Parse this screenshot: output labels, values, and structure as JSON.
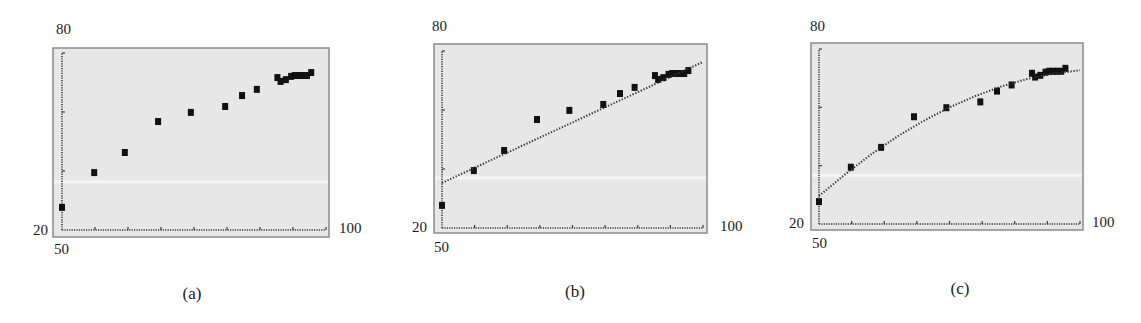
{
  "chart_data": [
    {
      "type": "scatter",
      "caption": "(a)",
      "title": "",
      "xlabel": "",
      "ylabel": "",
      "xlim": [
        50,
        100
      ],
      "ylim": [
        20,
        80
      ],
      "tick_labels": {
        "x_min": "50",
        "x_max": "100",
        "y_min": "20",
        "y_max": "80"
      },
      "grid": false,
      "legend": null,
      "series": [
        {
          "name": "data",
          "kind": "points",
          "x": [
            50,
            56.1,
            61.9,
            68.2,
            74.4,
            80.9,
            84.1,
            86.9,
            90.8,
            91.4,
            92.4,
            93.4,
            94.1,
            94.9,
            95.6,
            96.4,
            97.2
          ],
          "y": [
            27.5,
            39.3,
            46.1,
            56.6,
            59.7,
            61.7,
            65.4,
            67.5,
            71.5,
            70.2,
            70.8,
            71.9,
            72.2,
            72.2,
            72.2,
            72.2,
            73.2
          ]
        }
      ]
    },
    {
      "type": "scatter",
      "caption": "(b)",
      "title": "",
      "xlabel": "",
      "ylabel": "",
      "xlim": [
        50,
        100
      ],
      "ylim": [
        20,
        80
      ],
      "tick_labels": {
        "x_min": "50",
        "x_max": "100",
        "y_min": "20",
        "y_max": "80"
      },
      "grid": false,
      "legend": null,
      "series": [
        {
          "name": "data",
          "kind": "points",
          "x": [
            50,
            56.1,
            61.9,
            68.2,
            74.4,
            80.9,
            84.1,
            86.9,
            90.8,
            91.4,
            92.4,
            93.4,
            94.1,
            94.9,
            95.6,
            96.4,
            97.2
          ],
          "y": [
            27.5,
            39.3,
            46.1,
            56.6,
            59.7,
            61.7,
            65.4,
            67.5,
            71.5,
            70.2,
            70.8,
            71.9,
            72.2,
            72.2,
            72.2,
            72.2,
            73.2
          ]
        },
        {
          "name": "linear model",
          "kind": "dotted-line",
          "x": [
            50,
            100
          ],
          "y": [
            35.3,
            76.3
          ]
        }
      ]
    },
    {
      "type": "scatter",
      "caption": "(c)",
      "title": "",
      "xlabel": "",
      "ylabel": "",
      "xlim": [
        50,
        100
      ],
      "ylim": [
        20,
        80
      ],
      "tick_labels": {
        "x_min": "50",
        "x_max": "100",
        "y_min": "20",
        "y_max": "80"
      },
      "grid": false,
      "legend": null,
      "series": [
        {
          "name": "data",
          "kind": "points",
          "x": [
            50,
            56.1,
            61.9,
            68.2,
            74.4,
            80.9,
            84.1,
            86.9,
            90.8,
            91.4,
            92.4,
            93.4,
            94.1,
            94.9,
            95.6,
            96.4,
            97.2
          ],
          "y": [
            27.5,
            39.3,
            46.1,
            56.6,
            59.7,
            61.7,
            65.4,
            67.5,
            71.5,
            70.2,
            70.8,
            71.9,
            72.2,
            72.2,
            72.2,
            72.2,
            73.2
          ]
        },
        {
          "name": "quadratic model",
          "kind": "dotted-curve",
          "x": [
            50,
            55,
            60,
            65,
            70,
            75,
            80,
            85,
            90,
            95,
            100
          ],
          "y": [
            29.6,
            37.0,
            43.9,
            50.0,
            55.3,
            60.0,
            63.9,
            67.2,
            69.8,
            71.6,
            72.7
          ]
        }
      ]
    }
  ],
  "panels": [
    {
      "caption": "(a)",
      "y_max_label": "80",
      "y_min_label": "20",
      "x_min_label": "50",
      "x_max_label": "100"
    },
    {
      "caption": "(b)",
      "y_max_label": "80",
      "y_min_label": "20",
      "x_min_label": "50",
      "x_max_label": "100"
    },
    {
      "caption": "(c)",
      "y_max_label": "80",
      "y_min_label": "20",
      "x_min_label": "50",
      "x_max_label": "100"
    }
  ],
  "colors": {
    "plot_background": "#e7e7e7",
    "frame": "#8a8a8a",
    "axis": "#3a3a3a",
    "points": "#111111",
    "model_line": "#333333"
  }
}
